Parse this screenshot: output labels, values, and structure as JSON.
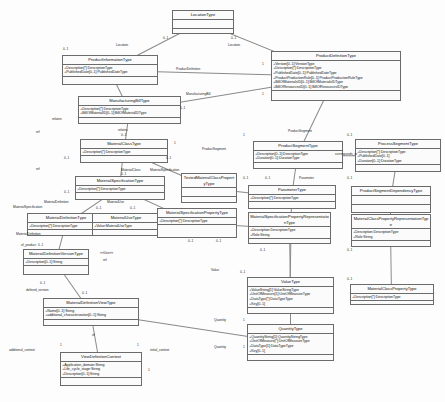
{
  "diagram": {
    "classes": [
      {
        "id": "location-type",
        "name": "LocationType",
        "attrs": [],
        "x": 172,
        "y": 10,
        "w": 62,
        "h": 24
      },
      {
        "id": "product-information-type",
        "name": "ProductInformationType",
        "attrs": [
          "+Description[*]:DescriptionType",
          "+PublishedDate[0..1]:PublishedDateType"
        ],
        "x": 62,
        "y": 55,
        "w": 96,
        "h": 30
      },
      {
        "id": "product-definition-type",
        "name": "ProductDefinitionType",
        "attrs": [
          "+Version[0..1]:VersionType",
          "+Description[*]:DescriptionType",
          "+PublishedDate[0..1]:PublishedDateType",
          "+ProductProductionRule[0..1]:ProductProductionRuleType",
          "+BillOfMaterialsID[0..1]:BillOfMaterialsIDType",
          "+BillOfResourcesID[0..1]:BillOfResourcesIDType"
        ],
        "x": 271,
        "y": 51,
        "w": 130,
        "h": 50
      },
      {
        "id": "manufacturing-bill-type",
        "name": "ManufacturingBillType",
        "attrs": [
          "+Description[*]:DescriptionType",
          "+BillOfMaterialID[0..1]:BillOfMaterialIDType"
        ],
        "x": 78,
        "y": 96,
        "w": 103,
        "h": 28
      },
      {
        "id": "material-class-type",
        "name": "MaterialClassType",
        "attrs": [
          "+Description[*]:DescriptionType"
        ],
        "x": 80,
        "y": 139,
        "w": 88,
        "h": 24
      },
      {
        "id": "material-specification-type",
        "name": "MaterialSpecificationType",
        "attrs": [
          "+Description[*]:DescriptionType"
        ],
        "x": 75,
        "y": 176,
        "w": 90,
        "h": 24
      },
      {
        "id": "product-segment-type",
        "name": "ProductSegmentType",
        "attrs": [
          "+Description[0..1]:DescriptionType",
          "+Duration[0..1]:DurationType"
        ],
        "x": 253,
        "y": 141,
        "w": 90,
        "h": 28
      },
      {
        "id": "process-segment-type",
        "name": "ProcessSegmentType",
        "attrs": [
          "+Description[*]:DescriptionType",
          "+PublishedDate[0..1]",
          "+Duration[0..1]:DurationType"
        ],
        "x": 355,
        "y": 139,
        "w": 86,
        "h": 33
      },
      {
        "id": "tested-material-class-property-type",
        "name": "TestedMaterialClassPropertyType",
        "attrs": [],
        "x": 181,
        "y": 173,
        "w": 56,
        "h": 30
      },
      {
        "id": "parameter-type",
        "name": "ParameterType",
        "attrs": [
          "+Description[*]:DescriptionType"
        ],
        "x": 248,
        "y": 185,
        "w": 88,
        "h": 24
      },
      {
        "id": "product-segment-dependency-type",
        "name": "ProductSegmentDependencyType",
        "attrs": [],
        "x": 351,
        "y": 186,
        "w": 80,
        "h": 27
      },
      {
        "id": "material-definition-type",
        "name": "MaterialDefinitionType",
        "attrs": [
          "+Description[*]:DescriptionType"
        ],
        "x": 27,
        "y": 213,
        "w": 78,
        "h": 23
      },
      {
        "id": "material-use-type",
        "name": "MaterialUseType",
        "attrs": [
          "+Value:MaterialUseType"
        ],
        "x": 92,
        "y": 213,
        "w": 68,
        "h": 23
      },
      {
        "id": "material-specification-property-type",
        "name": "MaterialSpecificationPropertyType",
        "attrs": [
          "+Description[*]:DescriptionType"
        ],
        "x": 157,
        "y": 208,
        "w": 80,
        "h": 30
      },
      {
        "id": "material-specification-property-representation-type",
        "name": "MaterialSpecificationPropertyRepresentationType",
        "attrs": [
          "+Description:DescriptionType",
          "+Role:String"
        ],
        "x": 248,
        "y": 212,
        "w": 83,
        "h": 32
      },
      {
        "id": "material-class-property-representation-type",
        "name": "MaterialClassPropertyRepresentationType",
        "attrs": [
          "+Description:DescriptionType",
          "+Role:String"
        ],
        "x": 351,
        "y": 214,
        "w": 80,
        "h": 33
      },
      {
        "id": "material-definition-version-type",
        "name": "MaterialDefinitionVersionType",
        "attrs": [
          "+Description[0..1]:String"
        ],
        "x": 23,
        "y": 249,
        "w": 66,
        "h": 26
      },
      {
        "id": "value-type",
        "name": "ValueType",
        "attrs": [
          "+ValueString[1]:ValueStringType",
          "+UnitOfMeasure[1]:UnitOfMeasureType",
          "+DataType[*]:DataTypeType",
          "+Key[0..1]"
        ],
        "x": 247,
        "y": 277,
        "w": 87,
        "h": 37
      },
      {
        "id": "material-class-property-type",
        "name": "MaterialClassPropertyType",
        "attrs": [
          "+Description[*]:DescriptionType"
        ],
        "x": 350,
        "y": 284,
        "w": 84,
        "h": 21
      },
      {
        "id": "material-definition-view-type",
        "name": "MaterialDefinitionViewType",
        "attrs": [
          "+Name[0..1]:String",
          "+additional_characterization[0..1]:String"
        ],
        "x": 43,
        "y": 298,
        "w": 96,
        "h": 28
      },
      {
        "id": "quantity-type",
        "name": "QuantityType",
        "attrs": [
          "+QuantityString[1]:QuantityStringType",
          "+UnitOfMeasure[*]:UnitOfMeasureType",
          "+DataType[1]:DataTypeType",
          "+Key[0..1]"
        ],
        "x": 247,
        "y": 324,
        "w": 87,
        "h": 37
      },
      {
        "id": "view-definition-context",
        "name": "ViewDefinitionContext",
        "attrs": [
          "+Application_domain:String",
          "+Life_cycle_stage:String",
          "+Description[0..1]:String"
        ],
        "x": 60,
        "y": 352,
        "w": 82,
        "h": 34
      }
    ],
    "role_labels": [
      {
        "text": "Location",
        "x": 116,
        "y": 43
      },
      {
        "text": "Location",
        "x": 228,
        "y": 43
      },
      {
        "text": "ProductDefinition",
        "x": 176,
        "y": 67
      },
      {
        "text": "ManufacturingBill",
        "x": 186,
        "y": 92
      },
      {
        "text": "relates",
        "x": 52,
        "y": 117
      },
      {
        "text": "ref",
        "x": 36,
        "y": 130
      },
      {
        "text": "relates",
        "x": 118,
        "y": 128
      },
      {
        "text": "ref",
        "x": 36,
        "y": 167
      },
      {
        "text": "ProductSegment",
        "x": 288,
        "y": 129
      },
      {
        "text": "ProductSegment",
        "x": 202,
        "y": 147
      },
      {
        "text": "corresponds_to",
        "x": 335,
        "y": 152
      },
      {
        "text": "MaterialClass",
        "x": 121,
        "y": 168
      },
      {
        "text": "MaterialSpecification",
        "x": 150,
        "y": 168
      },
      {
        "text": "Parameter",
        "x": 299,
        "y": 176
      },
      {
        "text": "MaterialDefinition",
        "x": 44,
        "y": 200
      },
      {
        "text": "MaterialUse",
        "x": 107,
        "y": 200
      },
      {
        "text": "MaterialSpecification",
        "x": 13,
        "y": 205
      },
      {
        "text": "MaterialDefinition",
        "x": 16,
        "y": 232
      },
      {
        "text": "of_product",
        "x": 21,
        "y": 243
      },
      {
        "text": "<<Use>>",
        "x": 100,
        "y": 251
      },
      {
        "text": "ref",
        "x": 103,
        "y": 258
      },
      {
        "text": "Value",
        "x": 211,
        "y": 268
      },
      {
        "text": "defined_version",
        "x": 26,
        "y": 288
      },
      {
        "text": "of",
        "x": 92,
        "y": 333
      },
      {
        "text": "Quantity",
        "x": 214,
        "y": 318
      },
      {
        "text": "Quantity",
        "x": 214,
        "y": 345
      },
      {
        "text": "additional_context",
        "x": 9,
        "y": 348
      },
      {
        "text": "initial_context",
        "x": 150,
        "y": 348
      }
    ],
    "multiplicities": [
      {
        "text": "0..1",
        "x": 163,
        "y": 36
      },
      {
        "text": "0..1",
        "x": 231,
        "y": 36
      },
      {
        "text": "0..1",
        "x": 63,
        "y": 47
      },
      {
        "text": "1",
        "x": 262,
        "y": 62
      },
      {
        "text": "1",
        "x": 262,
        "y": 92
      },
      {
        "text": "0..1",
        "x": 180,
        "y": 106
      },
      {
        "text": "0..1",
        "x": 121,
        "y": 133
      },
      {
        "text": "0..1",
        "x": 64,
        "y": 156
      },
      {
        "text": "0..1",
        "x": 166,
        "y": 156
      },
      {
        "text": "1",
        "x": 174,
        "y": 141
      },
      {
        "text": "0..1",
        "x": 121,
        "y": 172
      },
      {
        "text": "0..1",
        "x": 64,
        "y": 190
      },
      {
        "text": "1",
        "x": 243,
        "y": 133
      },
      {
        "text": "0..1",
        "x": 347,
        "y": 133
      },
      {
        "text": "0..1",
        "x": 347,
        "y": 176
      },
      {
        "text": "0..1",
        "x": 265,
        "y": 176
      },
      {
        "text": "0..1",
        "x": 243,
        "y": 176
      },
      {
        "text": "0..1",
        "x": 96,
        "y": 206
      },
      {
        "text": "0..1",
        "x": 130,
        "y": 206
      },
      {
        "text": "0..1",
        "x": 188,
        "y": 239
      },
      {
        "text": "0..1",
        "x": 216,
        "y": 239
      },
      {
        "text": "0..1",
        "x": 260,
        "y": 248
      },
      {
        "text": "0..1",
        "x": 347,
        "y": 248
      },
      {
        "text": "0..1",
        "x": 38,
        "y": 243
      },
      {
        "text": "0..1",
        "x": 40,
        "y": 281
      },
      {
        "text": "0..1",
        "x": 82,
        "y": 291
      },
      {
        "text": "0..1",
        "x": 240,
        "y": 270
      },
      {
        "text": "0..1",
        "x": 347,
        "y": 277
      },
      {
        "text": "1",
        "x": 243,
        "y": 318
      },
      {
        "text": "1",
        "x": 243,
        "y": 345
      },
      {
        "text": "1",
        "x": 60,
        "y": 343
      },
      {
        "text": "1",
        "x": 137,
        "y": 343
      },
      {
        "text": "1",
        "x": 148,
        "y": 368
      }
    ]
  }
}
